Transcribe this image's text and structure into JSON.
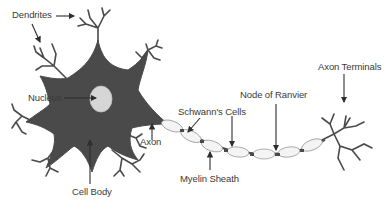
{
  "diagram": {
    "colors": {
      "cell": "#4a4a4a",
      "nucleus": "#d6d6d6",
      "myelin": "#f4f4f4",
      "myelin_stroke": "#9a9a9a",
      "arrow": "#2e2e2e",
      "text": "#3a3a3a"
    },
    "labels": {
      "dendrites": "Dendrites",
      "nucleus": "Nucleus",
      "cell_body": "Cell Body",
      "axon": "Axon",
      "schwanns_cells": "Schwann's Cells",
      "myelin_sheath": "Myelin Sheath",
      "node_of_ranvier": "Node of Ranvier",
      "axon_terminals": "Axon Terminals"
    }
  }
}
